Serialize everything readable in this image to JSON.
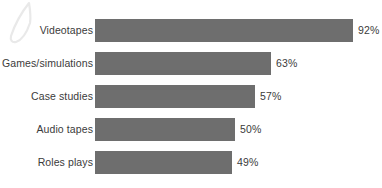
{
  "chart_data": {
    "type": "bar",
    "orientation": "horizontal",
    "title": "",
    "subtitle": "",
    "xlabel": "",
    "ylabel": "",
    "xlim": [
      0,
      100
    ],
    "grid": false,
    "legend": null,
    "value_suffix": "%",
    "categories": [
      "Videotapes",
      "Games/simulations",
      "Case studies",
      "Audio tapes",
      "Roles plays"
    ],
    "values": [
      92,
      63,
      57,
      50,
      49
    ],
    "data_labels": [
      "92%",
      "63%",
      "57%",
      "50%",
      "49%"
    ],
    "series": [
      {
        "name": "",
        "values": [
          92,
          63,
          57,
          50,
          49
        ]
      }
    ],
    "points": [
      {
        "category": "Videotapes",
        "value": 92,
        "label": "92%"
      },
      {
        "category": "Games/simulations",
        "value": 63,
        "label": "63%"
      },
      {
        "category": "Case studies",
        "value": 57,
        "label": "57%"
      },
      {
        "category": "Audio tapes",
        "value": 50,
        "label": "50%"
      },
      {
        "category": "Roles plays",
        "value": 49,
        "label": "49%"
      }
    ],
    "colors": {
      "bar": "#6e6e6e",
      "text": "#3b3b3b",
      "background": "#ffffff",
      "decoration": "#e8e8e8"
    }
  },
  "decoration": {
    "quill_icon": "quill-outline-icon"
  }
}
